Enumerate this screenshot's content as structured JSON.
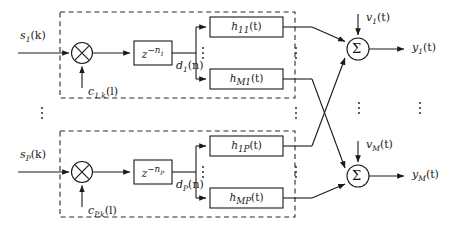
{
  "diagram": {
    "stroke_color": "#1a1a1a",
    "dash_color": "#2a2a2a",
    "background": "#ffffff"
  },
  "branches": [
    {
      "id": "branch-1",
      "input_label": "s",
      "input_sub": "1",
      "input_arg": "(k)",
      "code_label": "c",
      "code_sub": "1,k",
      "code_arg": "(l)",
      "delay_base": "z",
      "delay_exp": "−n",
      "delay_exp_sub": "1",
      "delayed_label": "d",
      "delayed_sub": "1",
      "delayed_arg": "(n)",
      "filters": [
        {
          "name": "h",
          "sub": "11",
          "arg": "(t)"
        },
        {
          "name": "h",
          "sub": "M1",
          "arg": "(t)"
        }
      ]
    },
    {
      "id": "branch-P",
      "input_label": "s",
      "input_sub": "P",
      "input_arg": "(k)",
      "code_label": "c",
      "code_sub": "P,k",
      "code_arg": "(l)",
      "delay_base": "z",
      "delay_exp": "−n",
      "delay_exp_sub": "P",
      "delayed_label": "d",
      "delayed_sub": "P",
      "delayed_arg": "(n)",
      "filters": [
        {
          "name": "h",
          "sub": "1P",
          "arg": "(t)"
        },
        {
          "name": "h",
          "sub": "MP",
          "arg": "(t)"
        }
      ]
    }
  ],
  "outputs": [
    {
      "id": "output-1",
      "noise_label": "v",
      "noise_sub": "1",
      "noise_arg": "(t)",
      "out_label": "y",
      "out_sub": "1",
      "out_arg": "(t)",
      "sum_symbol": "Σ"
    },
    {
      "id": "output-M",
      "noise_label": "v",
      "noise_sub": "M",
      "noise_arg": "(t)",
      "out_label": "y",
      "out_sub": "M",
      "out_arg": "(t)",
      "sum_symbol": "Σ"
    }
  ],
  "glyphs": {
    "multiply": "×",
    "sum": "Σ",
    "ellipsis_vertical": "⋮"
  }
}
